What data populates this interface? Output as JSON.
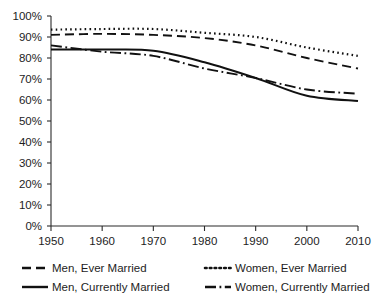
{
  "chart_data": {
    "type": "line",
    "title": "",
    "subtitle": "",
    "xlabel": "",
    "ylabel": "",
    "x": [
      1950,
      1960,
      1970,
      1980,
      1990,
      2000,
      2010
    ],
    "xlim": [
      1950,
      2010
    ],
    "ylim": [
      0,
      100
    ],
    "grid": false,
    "legend_position": "bottom",
    "x_tick_labels": [
      "1950",
      "1960",
      "1970",
      "1980",
      "1990",
      "2000",
      "2010"
    ],
    "y_tick_labels": [
      "0%",
      "10%",
      "20%",
      "30%",
      "40%",
      "50%",
      "60%",
      "70%",
      "80%",
      "90%",
      "100%"
    ],
    "y_tick_values": [
      0,
      10,
      20,
      30,
      40,
      50,
      60,
      70,
      80,
      90,
      100
    ],
    "series": [
      {
        "name": "Men, Ever Married",
        "style": "dashed",
        "dash": "9,5",
        "width": 1.9,
        "color": "#111111",
        "values": [
          91.0,
          91.5,
          91.0,
          89.5,
          86.0,
          80.0,
          75.0
        ]
      },
      {
        "name": "Women, Ever Married",
        "style": "dotted",
        "dash": "1.6,3.2",
        "width": 2.2,
        "color": "#111111",
        "values": [
          93.5,
          93.8,
          93.8,
          92.0,
          90.0,
          85.0,
          81.0
        ]
      },
      {
        "name": "Men, Currently Married",
        "style": "solid",
        "dash": "none",
        "width": 2.0,
        "color": "#111111",
        "values": [
          84.0,
          84.0,
          83.5,
          78.0,
          70.5,
          62.0,
          59.5
        ]
      },
      {
        "name": "Women, Currently Married",
        "style": "dash-dot",
        "dash": "11,3.5,1.8,3.5",
        "width": 1.9,
        "color": "#111111",
        "values": [
          86.0,
          83.0,
          81.0,
          75.0,
          70.5,
          65.0,
          63.0
        ]
      }
    ]
  },
  "legend": {
    "items": [
      {
        "label": "Men, Ever Married",
        "swatch": "dashed-line-swatch"
      },
      {
        "label": "Women, Ever Married",
        "swatch": "dotted-line-swatch"
      },
      {
        "label": "Men, Currently Married",
        "swatch": "solid-line-swatch"
      },
      {
        "label": "Women, Currently Married",
        "swatch": "dash-dot-line-swatch"
      }
    ]
  },
  "axis": {
    "x_axis_name": "year-axis",
    "y_axis_name": "percent-axis"
  }
}
